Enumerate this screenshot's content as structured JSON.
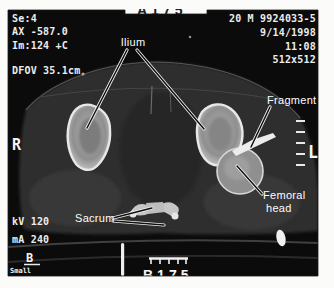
{
  "captions": {
    "top": "A175",
    "bottom": "B175"
  },
  "scanner": {
    "series": "Se:4",
    "slice_position": "AX -587.0",
    "image_number": "Im:124 +C",
    "dfov": "DFOV 35.1cm",
    "demographics": "20 M 9924033-5",
    "date": "9/14/1998",
    "time": "11:08",
    "matrix": "512x512",
    "kv": "kV 120",
    "ma": "mA 240",
    "right_marker": "R",
    "left_marker": "L",
    "panel_label": "B",
    "panel_sublabel": "Small"
  },
  "annotations": {
    "ilium": "Ilium",
    "fragment": "Fragment",
    "femoral_head_line1": "Femoral",
    "femoral_head_line2": "head",
    "sacrum": "Sacrum"
  },
  "colors": {
    "page_bg": "#fbfbfa",
    "photo_bg": "#0b0b0b",
    "soft_tissue": "#2f2f2f",
    "bone_fill": "#9b9b9b",
    "bone_rim": "#e8e8e8",
    "overlay_text": "#ededed",
    "caption_text": "#1c1c1c"
  }
}
